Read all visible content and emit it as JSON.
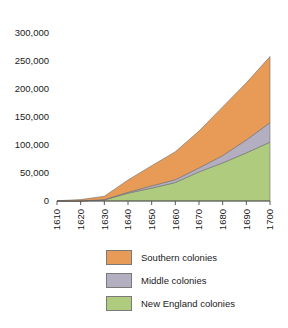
{
  "chart_data": {
    "type": "area",
    "stacked": true,
    "title": "",
    "subtitle": "",
    "xlabel": "",
    "ylabel": "",
    "x": [
      1610,
      1620,
      1630,
      1640,
      1650,
      1660,
      1670,
      1680,
      1690,
      1700
    ],
    "categories": [
      "1610",
      "1620",
      "1630",
      "1640",
      "1650",
      "1660",
      "1670",
      "1680",
      "1690",
      "1700"
    ],
    "series": [
      {
        "name": "New England colonies",
        "color": "#AFCB7E",
        "values": [
          0,
          0,
          2000,
          14000,
          23000,
          33000,
          52000,
          68000,
          86000,
          105000
        ]
      },
      {
        "name": "Middle colonies",
        "color": "#B3AEC0",
        "values": [
          0,
          0,
          500,
          1500,
          4000,
          5000,
          7000,
          13000,
          23000,
          35000
        ]
      },
      {
        "name": "Southern colonies",
        "color": "#E89B56",
        "values": [
          500,
          2500,
          6000,
          22000,
          36000,
          50000,
          66000,
          87000,
          102000,
          118000
        ]
      }
    ],
    "ylim": [
      0,
      300000
    ],
    "xlim": [
      1610,
      1700
    ],
    "yticks": [
      0,
      50000,
      100000,
      150000,
      200000,
      250000,
      300000
    ],
    "ytick_labels": [
      "0",
      "50,000",
      "100,000",
      "150,000",
      "200,000",
      "250,000",
      "300,000"
    ],
    "xticks": [
      1610,
      1620,
      1630,
      1640,
      1650,
      1660,
      1670,
      1680,
      1690,
      1700
    ],
    "xtick_labels": [
      "1610",
      "1620",
      "1630",
      "1640",
      "1650",
      "1660",
      "1670",
      "1680",
      "1690",
      "1700"
    ],
    "grid": false,
    "legend_position": "bottom",
    "legend_order": [
      "Southern colonies",
      "Middle colonies",
      "New England colonies"
    ]
  },
  "legend": {
    "items": [
      {
        "label": "Southern colonies",
        "color": "#E89B56"
      },
      {
        "label": "Middle colonies",
        "color": "#B3AEC0"
      },
      {
        "label": "New England colonies",
        "color": "#AFCB7E"
      }
    ]
  }
}
